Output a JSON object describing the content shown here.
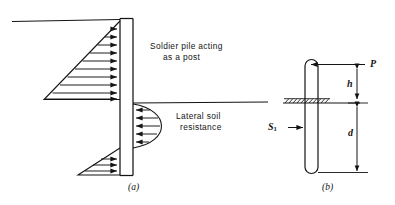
{
  "figure": {
    "kind": "engineering-diagram",
    "ink_color": "#141414",
    "background_color": "#ffffff"
  },
  "panel_a": {
    "caption": "(a)",
    "labels": {
      "pile_line1": "Soldier pile acting",
      "pile_line2": "as a post",
      "resistance_line1": "Lateral soil",
      "resistance_line2": "resistance"
    },
    "elements": {
      "upper_ground_line": "ground-line-left",
      "lower_ground_line": "ground-line-right",
      "active_pressure_wedge": "triangular-distribution",
      "passive_resistance_bulb": "parabolic-distribution",
      "toe_wedge": "small-triangular-distribution",
      "pile": "vertical-double-line-column"
    },
    "arrow_counts": {
      "active_wedge": 10,
      "passive_bulb": 5,
      "toe_wedge": 3
    },
    "arrow_directions": {
      "active_wedge": "right",
      "passive_bulb": "left",
      "toe_wedge": "right"
    }
  },
  "panel_b": {
    "caption": "(b)",
    "labels": {
      "load": "P",
      "height_above_ground": "h",
      "embedded_depth": "d",
      "soil_resistance": "S",
      "soil_resistance_subscript": "1"
    },
    "elements": {
      "pile": "rounded-end-vertical-member",
      "ground_line": "hatched-ground-surface",
      "load_arrow": "point-load-arrow-left",
      "h_dimension": "double-headed-dimension-line",
      "d_dimension": "double-headed-dimension-line",
      "s1_arrow": "soil-reaction-arrow-right"
    }
  }
}
